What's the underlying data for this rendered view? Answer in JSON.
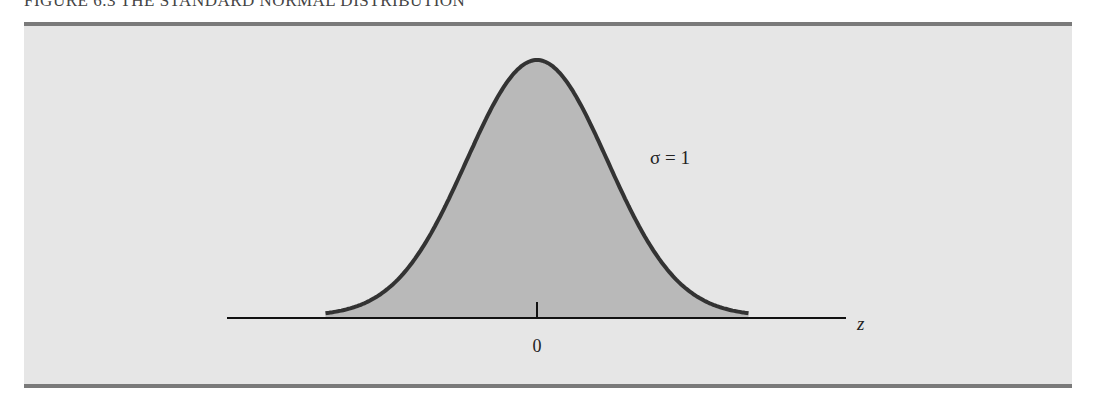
{
  "caption": "FIGURE 6.3   THE STANDARD NORMAL DISTRIBUTION",
  "annotation": "σ = 1",
  "x_axis_label": "z",
  "tick_label": "0",
  "colors": {
    "panel": "#e6e6e6",
    "border": "#7a7a7a",
    "fill": "#b9b9b9",
    "curve": "#333333",
    "axis": "#111111"
  },
  "chart_data": {
    "type": "area",
    "title": "THE STANDARD NORMAL DISTRIBUTION",
    "xlabel": "z",
    "ylabel": "",
    "distribution": "standard normal",
    "mean": 0,
    "sd": 1,
    "x": [
      -3,
      -2.5,
      -2,
      -1.5,
      -1,
      -0.5,
      0,
      0.5,
      1,
      1.5,
      2,
      2.5,
      3
    ],
    "values": [
      0.0044,
      0.0175,
      0.054,
      0.1295,
      0.242,
      0.3521,
      0.3989,
      0.3521,
      0.242,
      0.1295,
      0.054,
      0.0175,
      0.0044
    ],
    "x_ticks": [
      "0"
    ],
    "annotations": [
      "σ = 1"
    ],
    "grid": false,
    "legend": null
  }
}
